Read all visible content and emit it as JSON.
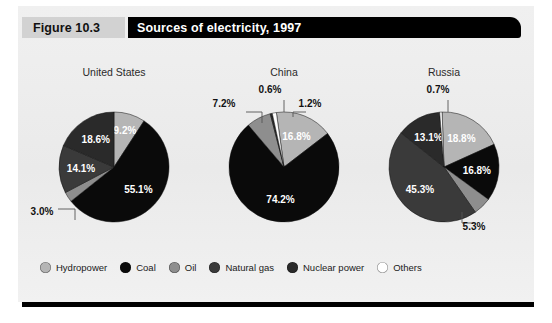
{
  "figure": {
    "tag": "Figure 10.3",
    "title": "Sources of electricity, 1997"
  },
  "legend": {
    "items": [
      {
        "label": "Hydropower",
        "color": "#b5b5b5"
      },
      {
        "label": "Coal",
        "color": "#0a0a0a"
      },
      {
        "label": "Oil",
        "color": "#8e8e8e"
      },
      {
        "label": "Natural gas",
        "color": "#3a3a3a"
      },
      {
        "label": "Nuclear power",
        "color": "#2a2a2a"
      },
      {
        "label": "Others",
        "color": "#ffffff"
      }
    ]
  },
  "chart_data": {
    "type": "pie",
    "title": "Sources of electricity, 1997",
    "unit": "percent",
    "legend_position": "bottom",
    "categories": [
      "Hydropower",
      "Coal",
      "Oil",
      "Natural gas",
      "Nuclear power",
      "Others"
    ],
    "colors": [
      "#b5b5b5",
      "#0a0a0a",
      "#8e8e8e",
      "#3a3a3a",
      "#2a2a2a",
      "#ffffff"
    ],
    "charts": [
      {
        "name": "United States",
        "slices": [
          {
            "category": "Hydropower",
            "value": 9.2,
            "label": "9.2%",
            "color": "#b5b5b5",
            "label_pos": "inside"
          },
          {
            "category": "Coal",
            "value": 55.1,
            "label": "55.1%",
            "color": "#0a0a0a",
            "label_pos": "inside"
          },
          {
            "category": "Oil",
            "value": 3.0,
            "label": "3.0%",
            "color": "#8e8e8e",
            "label_pos": "outside"
          },
          {
            "category": "Natural gas",
            "value": 14.1,
            "label": "14.1%",
            "color": "#3a3a3a",
            "label_pos": "inside"
          },
          {
            "category": "Nuclear power",
            "value": 18.6,
            "label": "18.6%",
            "color": "#2a2a2a",
            "label_pos": "inside"
          }
        ]
      },
      {
        "name": "China",
        "slices": [
          {
            "category": "Hydropower",
            "value": 16.8,
            "label": "16.8%",
            "color": "#b5b5b5",
            "label_pos": "inside"
          },
          {
            "category": "Coal",
            "value": 74.2,
            "label": "74.2%",
            "color": "#0a0a0a",
            "label_pos": "inside"
          },
          {
            "category": "Oil",
            "value": 7.2,
            "label": "7.2%",
            "color": "#8e8e8e",
            "label_pos": "outside"
          },
          {
            "category": "Nuclear power",
            "value": 0.6,
            "label": "0.6%",
            "color": "#2a2a2a",
            "label_pos": "outside"
          },
          {
            "category": "Others",
            "value": 1.2,
            "label": "1.2%",
            "color": "#ffffff",
            "label_pos": "outside"
          }
        ]
      },
      {
        "name": "Russia",
        "slices": [
          {
            "category": "Hydropower",
            "value": 18.8,
            "label": "18.8%",
            "color": "#b5b5b5",
            "label_pos": "inside"
          },
          {
            "category": "Coal",
            "value": 16.8,
            "label": "16.8%",
            "color": "#0a0a0a",
            "label_pos": "inside"
          },
          {
            "category": "Oil",
            "value": 5.3,
            "label": "5.3%",
            "color": "#8e8e8e",
            "label_pos": "outside"
          },
          {
            "category": "Natural gas",
            "value": 45.3,
            "label": "45.3%",
            "color": "#3a3a3a",
            "label_pos": "inside"
          },
          {
            "category": "Nuclear power",
            "value": 13.1,
            "label": "13.1%",
            "color": "#2a2a2a",
            "label_pos": "inside"
          },
          {
            "category": "Others",
            "value": 0.7,
            "label": "0.7%",
            "color": "#ffffff",
            "label_pos": "outside"
          }
        ]
      }
    ]
  }
}
